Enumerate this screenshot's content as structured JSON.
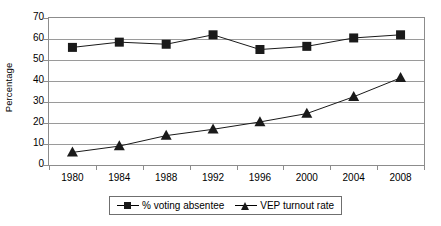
{
  "chart_data": {
    "type": "line",
    "title": "",
    "xlabel": "",
    "ylabel": "Percentage",
    "categories": [
      "1980",
      "1984",
      "1988",
      "1992",
      "1996",
      "2000",
      "2004",
      "2008"
    ],
    "ylim": [
      0,
      70
    ],
    "ytick_step": 10,
    "yticks": [
      "0",
      "10",
      "20",
      "30",
      "40",
      "50",
      "60",
      "70"
    ],
    "grid": "horizontal",
    "legend_position": "bottom",
    "series": [
      {
        "name": "% voting absentee",
        "marker": "square",
        "color": "#1a1a1a",
        "values": [
          56,
          58.5,
          57.5,
          62,
          55,
          56.5,
          60.5,
          62
        ]
      },
      {
        "name": "VEP turnout rate",
        "marker": "triangle",
        "color": "#1a1a1a",
        "values": [
          6,
          9,
          14,
          17,
          20.5,
          24.5,
          32.5,
          41.5
        ]
      }
    ]
  },
  "axis": {
    "y_title": "Percentage",
    "y_tick_labels": [
      "70",
      "60",
      "50",
      "40",
      "30",
      "20",
      "10",
      "0"
    ],
    "x_tick_labels": [
      "1980",
      "1984",
      "1988",
      "1992",
      "1996",
      "2000",
      "2004",
      "2008"
    ]
  },
  "legend": {
    "items": [
      {
        "label": "% voting absentee",
        "marker": "square-marker-icon"
      },
      {
        "label": "VEP turnout rate",
        "marker": "triangle-marker-icon"
      }
    ]
  },
  "style": {
    "axis_color": "#8c8c8c",
    "grid_color": "#9a9a9a",
    "series_color": "#1a1a1a",
    "legend_border": "#6f6f6f",
    "background": "#ffffff"
  }
}
